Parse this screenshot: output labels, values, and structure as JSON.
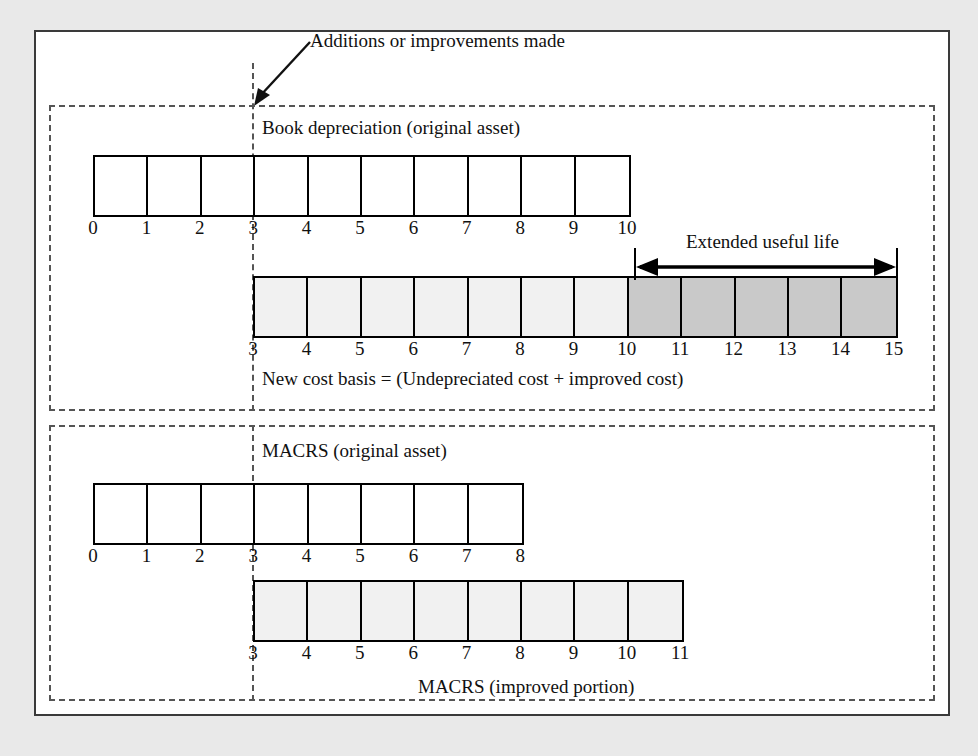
{
  "figure": {
    "callout": {
      "text": "Additions or improvements made",
      "marker_year": 3
    },
    "sections": [
      {
        "id": "book",
        "caption": "Book depreciation (original asset)",
        "bars": [
          {
            "name": "original-asset-book",
            "start": 0,
            "end": 10,
            "ticks": [
              "0",
              "1",
              "2",
              "3",
              "4",
              "5",
              "6",
              "7",
              "8",
              "9",
              "10"
            ],
            "segments": [
              {
                "from": 0,
                "to": 10,
                "shade": "white"
              }
            ]
          },
          {
            "name": "new-cost-basis",
            "start": 3,
            "end": 15,
            "ticks": [
              "3",
              "4",
              "5",
              "6",
              "7",
              "8",
              "9",
              "10",
              "11",
              "12",
              "13",
              "14",
              "15"
            ],
            "segments": [
              {
                "from": 3,
                "to": 10,
                "shade": "light"
              },
              {
                "from": 10,
                "to": 15,
                "shade": "dark"
              }
            ]
          }
        ],
        "annotation": {
          "label": "Extended useful life",
          "from": 10,
          "to": 15
        },
        "footer_caption": "New cost basis = (Undepreciated cost + improved cost)"
      },
      {
        "id": "macrs",
        "caption": "MACRS (original asset)",
        "bars": [
          {
            "name": "macrs-original-asset",
            "start": 0,
            "end": 8,
            "ticks": [
              "0",
              "1",
              "2",
              "3",
              "4",
              "5",
              "6",
              "7",
              "8"
            ],
            "segments": [
              {
                "from": 0,
                "to": 8,
                "shade": "white"
              }
            ]
          },
          {
            "name": "macrs-improved-portion",
            "start": 3,
            "end": 11,
            "ticks": [
              "3",
              "4",
              "5",
              "6",
              "7",
              "8",
              "9",
              "10",
              "11"
            ],
            "segments": [
              {
                "from": 3,
                "to": 11,
                "shade": "light"
              }
            ]
          }
        ],
        "footer_caption": "MACRS (improved portion)"
      }
    ],
    "colors": {
      "frame": "#3a3a3a",
      "dashed": "#555555",
      "bar_outline": "#000000",
      "shade_white": "#ffffff",
      "shade_light": "#f1f1f1",
      "shade_dark": "#c9c9c9",
      "page_background": "#e9e9e9",
      "text": "#111111"
    }
  }
}
